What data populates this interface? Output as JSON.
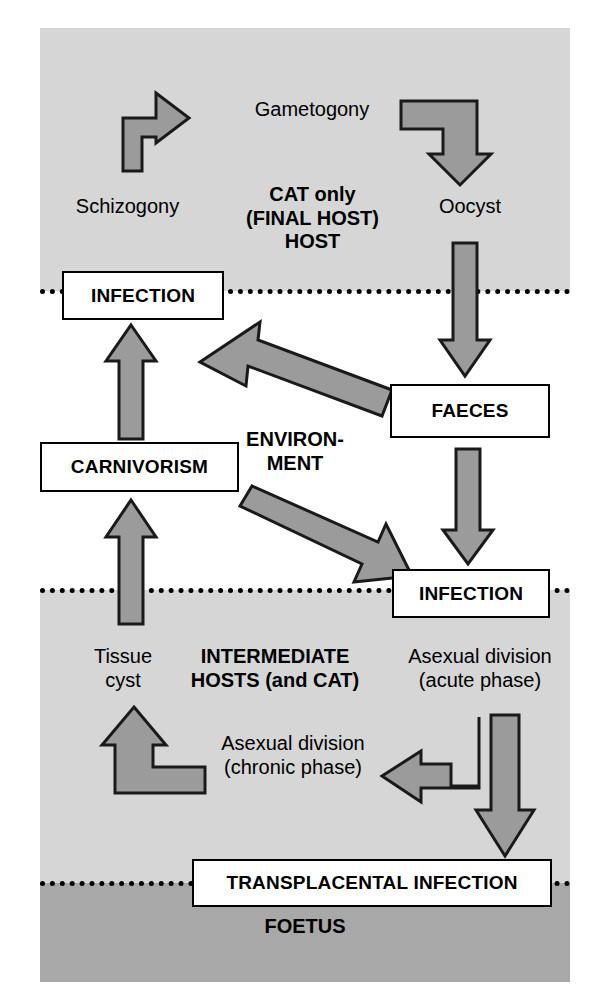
{
  "diagram": {
    "colors": {
      "host_band": "#d6d6d6",
      "environment_band": "#ffffff",
      "foetus_band": "#a8a8a8",
      "arrow_fill": "#9b9b9b",
      "arrow_stroke": "#1a1a1a",
      "box_fill": "#ffffff",
      "text": "#000000"
    },
    "bands": [
      {
        "id": "cat-host",
        "label": "CAT only (FINAL HOST) HOST"
      },
      {
        "id": "environment",
        "label": "ENVIRON-MENT"
      },
      {
        "id": "intermediate-hosts",
        "label": "INTERMEDIATE HOSTS (and CAT)"
      },
      {
        "id": "foetus",
        "label": "FOETUS"
      }
    ],
    "boxes": {
      "infection_top": "INFECTION",
      "faeces": "FAECES",
      "carnivorism": "CARNIVORISM",
      "infection_mid": "INFECTION",
      "transplacental": "TRANSPLACENTAL INFECTION"
    },
    "labels": {
      "gametogony": "Gametogony",
      "schizogony": "Schizogony",
      "cat_only_line1": "CAT only",
      "cat_only_line2": "(FINAL HOST)",
      "cat_only_line3": "HOST",
      "oocyst": "Oocyst",
      "environment_line1": "ENVIRON-",
      "environment_line2": "MENT",
      "tissue_cyst_line1": "Tissue",
      "tissue_cyst_line2": "cyst",
      "intermediate_line1": "INTERMEDIATE",
      "intermediate_line2": "HOSTS (and CAT)",
      "asexual_acute_line1": "Asexual division",
      "asexual_acute_line2": "(acute phase)",
      "asexual_chronic_line1": "Asexual division",
      "asexual_chronic_line2": "(chronic phase)",
      "foetus": "FOETUS"
    },
    "arrows": [
      {
        "id": "schizogony-to-gametogony",
        "kind": "elbow-up-right"
      },
      {
        "id": "gametogony-to-oocyst",
        "kind": "elbow-right-down"
      },
      {
        "id": "oocyst-to-faeces",
        "kind": "straight-down"
      },
      {
        "id": "carnivorism-to-infection",
        "kind": "straight-up"
      },
      {
        "id": "environment-to-infection-top",
        "kind": "diagonal-up-left"
      },
      {
        "id": "faeces-to-infection-mid",
        "kind": "straight-down"
      },
      {
        "id": "environment-to-infection-mid",
        "kind": "diagonal-down-right"
      },
      {
        "id": "tissue-cyst-to-carnivorism",
        "kind": "straight-up"
      },
      {
        "id": "chronic-to-tissue-cyst",
        "kind": "elbow-left-up"
      },
      {
        "id": "acute-to-chronic",
        "kind": "elbow-down-left"
      },
      {
        "id": "acute-to-transplacental",
        "kind": "straight-down"
      }
    ]
  }
}
